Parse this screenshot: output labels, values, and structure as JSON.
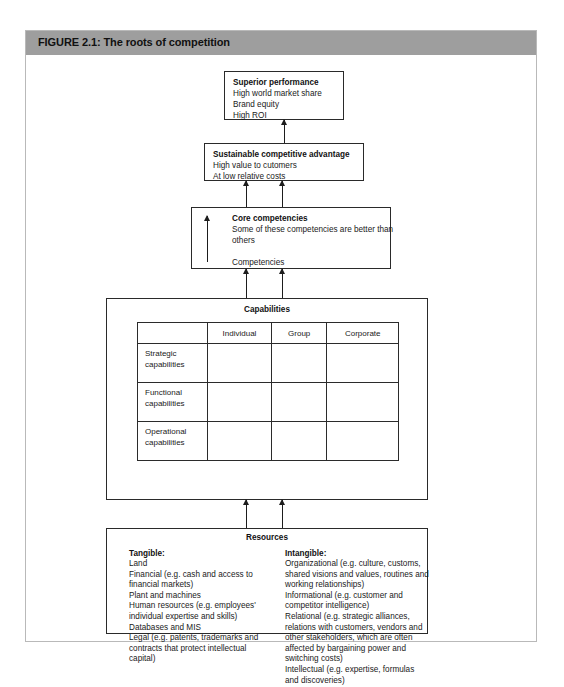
{
  "figure": {
    "label": "FIGURE 2.1: The roots of competition"
  },
  "boxes": {
    "superior_performance": {
      "heading": "Superior performance",
      "lines": [
        "High world market share",
        "Brand equity",
        "High ROI"
      ]
    },
    "sustainable_advantage": {
      "heading": "Sustainable competitive advantage",
      "lines": [
        "High value to cutomers",
        "At low relative costs"
      ]
    },
    "core_competencies": {
      "heading": "Core competencies",
      "lines": [
        "Some of these competencies are better than",
        "others"
      ],
      "footer": "Competencies"
    },
    "capabilities": {
      "title": "Capabilities"
    },
    "resources": {
      "title": "Resources",
      "tangible": {
        "heading": "Tangible:",
        "lines": [
          "Land",
          "Financial (e.g. cash and access to",
          "financial markets)",
          "Plant and machines",
          "Human resources (e.g. employees'",
          "individual expertise and skills)",
          "Databases and MIS",
          "Legal (e.g. patents, trademarks and",
          "contracts that protect intellectual",
          "capital)"
        ]
      },
      "intangible": {
        "heading": "Intangible:",
        "lines": [
          "Organizational (e.g. culture, customs,",
          "shared visions and values, routines and",
          "working relationships)",
          "Informational (e.g. customer and",
          "competitor intelligence)",
          "Relational (e.g. strategic alliances,",
          "relations with customers, vendors and",
          "other stakeholders, which are often",
          "affected by bargaining power and",
          "switching costs)",
          "Intellectual (e.g. expertise, formulas",
          "and discoveries)"
        ]
      }
    }
  },
  "capabilities_table": {
    "columns": [
      "",
      "Individual",
      "Group",
      "Corporate"
    ],
    "rows": [
      {
        "label_line1": "Strategic",
        "label_line2": "capabilities",
        "cells": [
          "",
          "",
          ""
        ]
      },
      {
        "label_line1": "Functional",
        "label_line2": "capabilities",
        "cells": [
          "",
          "",
          ""
        ]
      },
      {
        "label_line1": "Operational",
        "label_line2": "capabilities",
        "cells": [
          "",
          "",
          ""
        ]
      }
    ]
  },
  "colors": {
    "header_bar": "#9e9e9e",
    "frame": "#b9b9b9",
    "line": "#2a2a2a",
    "page": "#ffffff"
  }
}
